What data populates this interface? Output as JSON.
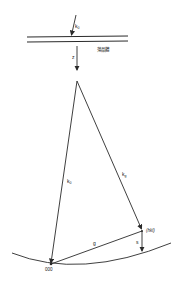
{
  "diagram": {
    "labels": {
      "incident_beam": "k",
      "incident_beam_sub": "0",
      "crystal": "薄晶體",
      "z_axis": "z",
      "k0": "k",
      "k0_sub": "0",
      "kg": "k",
      "kg_sub": "g",
      "reciprocal_vector": "g",
      "excitation_error": "s",
      "origin": "000",
      "hkl_point": "(hkl)"
    },
    "colors": {
      "line": "#2a2a2a",
      "background": "#ffffff"
    }
  }
}
